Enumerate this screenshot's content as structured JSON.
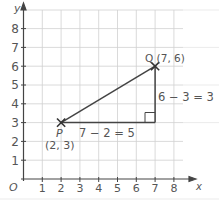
{
  "axes": {
    "x_label": "x",
    "y_label": "y",
    "origin_label": "O",
    "x_ticks": [
      "1",
      "2",
      "3",
      "4",
      "5",
      "6",
      "7",
      "8"
    ],
    "y_ticks": [
      "1",
      "2",
      "3",
      "4",
      "5",
      "6",
      "7",
      "8"
    ]
  },
  "points": {
    "P": {
      "name": "P",
      "coords": "(2, 3)",
      "x": 2,
      "y": 3
    },
    "Q": {
      "name": "Q",
      "coords": "Q (7, 6)",
      "x": 7,
      "y": 6
    }
  },
  "annotations": {
    "horizontal": "7 − 2 = 5",
    "vertical": "6 − 3 = 3"
  },
  "colors": {
    "grid": "#cfcfcf",
    "lines": "#444444",
    "text": "#555555"
  }
}
